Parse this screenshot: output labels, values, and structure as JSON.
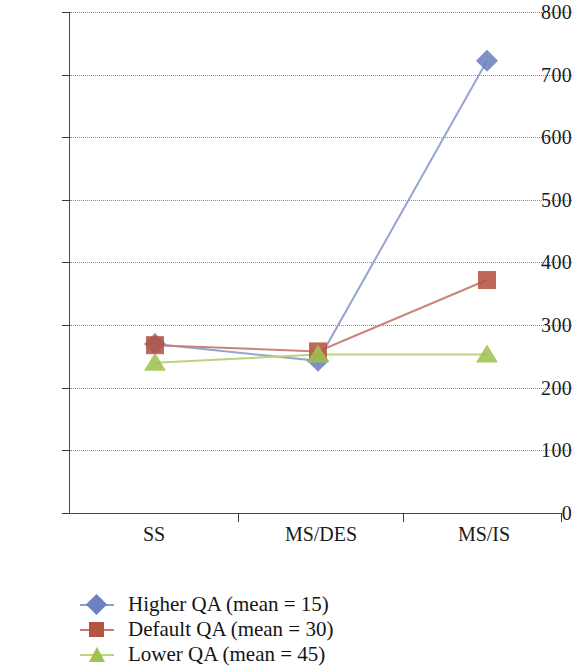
{
  "chart_data": {
    "type": "line",
    "title": "",
    "subtitle": "",
    "xlabel": "",
    "ylabel": "",
    "categories": [
      "SS",
      "MS/DES",
      "MS/IS"
    ],
    "ylim": [
      0,
      800
    ],
    "y_ticks": [
      0,
      100,
      200,
      300,
      400,
      500,
      600,
      700,
      800
    ],
    "y_tick_labels": [
      "0",
      "100",
      "200",
      "300",
      "400",
      "500",
      "600",
      "700",
      "800"
    ],
    "grid": "horizontal-dotted",
    "legend_position": "bottom-left",
    "series": [
      {
        "name": "Higher QA (mean = 15)",
        "marker": "diamond",
        "color": "#6d80bf",
        "values": [
          270,
          243,
          722
        ]
      },
      {
        "name": "Default QA (mean = 30)",
        "marker": "square",
        "color": "#b65442",
        "values": [
          268,
          258,
          372
        ]
      },
      {
        "name": "Lower QA (mean = 45)",
        "marker": "triangle",
        "color": "#9fc24e",
        "values": [
          240,
          253,
          253
        ]
      }
    ]
  },
  "axis": {
    "y_labels": [
      "800",
      "700",
      "600",
      "500",
      "400",
      "300",
      "200",
      "100",
      "0"
    ],
    "x_labels": [
      "SS",
      "MS/DES",
      "MS/IS"
    ]
  },
  "legend": {
    "items": [
      {
        "label": "Higher QA (mean = 15)",
        "marker": "diamond-marker",
        "color": "#6d80bf"
      },
      {
        "label": "Default QA (mean = 30)",
        "marker": "square-marker",
        "color": "#b65442"
      },
      {
        "label": "Lower QA (mean = 45)",
        "marker": "triangle-marker",
        "color": "#9fc24e"
      }
    ]
  }
}
